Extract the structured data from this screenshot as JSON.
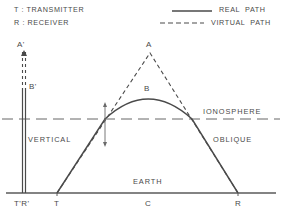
{
  "legend": {
    "keys": [
      {
        "symbol": "T",
        "sep": " : ",
        "text": "TRANSMITTER",
        "full": "T : TRANSMITTER"
      },
      {
        "symbol": "R",
        "sep": " : ",
        "text": "RECEIVER",
        "full": "R : RECEIVER"
      }
    ],
    "paths": [
      {
        "style": "solid",
        "label": "REAL  PATH"
      },
      {
        "style": "dashed",
        "label": "VIRTUAL  PATH"
      }
    ]
  },
  "labels": {
    "a_prime": "A'",
    "b_prime": "B'",
    "apex_virtual": "A",
    "apex_real": "B",
    "ionosphere": "IONOSPHERE",
    "vertical": "VERTICAL",
    "oblique": "OBLIQUE",
    "earth": "EARTH"
  },
  "axis_labels": {
    "t_prime_r_prime": "T'R'",
    "transmitter": "T",
    "center": "C",
    "receiver": "R"
  },
  "colors": {
    "ink": "#4a4a4a",
    "line": "#555555",
    "ground": "#5a5a5a"
  },
  "geometry": {
    "earth_y": 193,
    "ionosphere_y": 119,
    "transmitter_x": 57,
    "receiver_x": 238,
    "center_x": 148,
    "antenna_x": 24,
    "apex_virtual": {
      "x": 150,
      "y": 53
    },
    "apex_real": {
      "x": 148,
      "y": 97
    },
    "cross_left": {
      "x": 105,
      "y": 119
    },
    "cross_right": {
      "x": 192,
      "y": 119
    }
  }
}
